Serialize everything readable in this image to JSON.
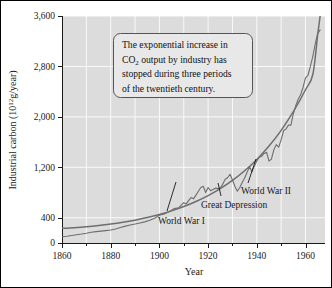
{
  "chart_data": {
    "type": "line",
    "title": "",
    "xlabel": "Year",
    "ylabel": "Industrial carbon (10^12 g/year)",
    "ylabel_parts": {
      "prefix": "Industrial carbon (10",
      "exponent": "12",
      "suffix": "g/year)"
    },
    "xlim": [
      1860,
      1968
    ],
    "ylim": [
      0,
      3600
    ],
    "grid": true,
    "grid_color": "#ffffff",
    "plot_background": "#dcdcdc",
    "legend": "none",
    "x_major_ticks": [
      1860,
      1880,
      1900,
      1920,
      1940,
      1960
    ],
    "x_major_tick_labels": [
      "1860",
      "1880",
      "1900",
      "1920",
      "1940",
      "1960"
    ],
    "x_minor_ticks": [
      1870,
      1890,
      1910,
      1930,
      1950
    ],
    "y_major_ticks": [
      0,
      400,
      1200,
      2000,
      2800,
      3600
    ],
    "y_major_tick_labels": [
      "0",
      "400",
      "1,200",
      "2,000",
      "2,800",
      "3,600"
    ],
    "series": [
      {
        "name": "Exponential fit",
        "style": "smooth",
        "color": "#6e6e6e",
        "points": [
          [
            1860,
            232
          ],
          [
            1865,
            243
          ],
          [
            1870,
            258
          ],
          [
            1875,
            277
          ],
          [
            1880,
            300
          ],
          [
            1885,
            328
          ],
          [
            1890,
            362
          ],
          [
            1895,
            403
          ],
          [
            1900,
            452
          ],
          [
            1905,
            510
          ],
          [
            1910,
            578
          ],
          [
            1915,
            658
          ],
          [
            1920,
            752
          ],
          [
            1925,
            862
          ],
          [
            1930,
            992
          ],
          [
            1935,
            1145
          ],
          [
            1940,
            1325
          ],
          [
            1945,
            1537
          ],
          [
            1950,
            1787
          ],
          [
            1955,
            2082
          ],
          [
            1960,
            2430
          ],
          [
            1963,
            2672
          ],
          [
            1965,
            3305
          ],
          [
            1966,
            3600
          ]
        ]
      },
      {
        "name": "Industrial carbon emissions",
        "style": "jagged",
        "color": "#6e6e6e",
        "points": [
          [
            1860,
            100
          ],
          [
            1862,
            108
          ],
          [
            1864,
            120
          ],
          [
            1866,
            132
          ],
          [
            1868,
            142
          ],
          [
            1870,
            155
          ],
          [
            1872,
            170
          ],
          [
            1874,
            180
          ],
          [
            1876,
            188
          ],
          [
            1878,
            196
          ],
          [
            1880,
            205
          ],
          [
            1882,
            222
          ],
          [
            1884,
            245
          ],
          [
            1886,
            268
          ],
          [
            1888,
            285
          ],
          [
            1890,
            300
          ],
          [
            1892,
            318
          ],
          [
            1894,
            335
          ],
          [
            1896,
            360
          ],
          [
            1898,
            392
          ],
          [
            1900,
            440
          ],
          [
            1902,
            462
          ],
          [
            1904,
            495
          ],
          [
            1906,
            545
          ],
          [
            1908,
            560
          ],
          [
            1909,
            600
          ],
          [
            1910,
            640
          ],
          [
            1911,
            620
          ],
          [
            1912,
            672
          ],
          [
            1913,
            720
          ],
          [
            1914,
            700
          ],
          [
            1915,
            760
          ],
          [
            1916,
            820
          ],
          [
            1917,
            880
          ],
          [
            1918,
            900
          ],
          [
            1919,
            800
          ],
          [
            1920,
            880
          ],
          [
            1921,
            830
          ],
          [
            1922,
            850
          ],
          [
            1923,
            870
          ],
          [
            1924,
            862
          ],
          [
            1925,
            880
          ],
          [
            1926,
            930
          ],
          [
            1927,
            1010
          ],
          [
            1928,
            1035
          ],
          [
            1929,
            1090
          ],
          [
            1930,
            1000
          ],
          [
            1931,
            900
          ],
          [
            1932,
            820
          ],
          [
            1933,
            880
          ],
          [
            1934,
            960
          ],
          [
            1935,
            1030
          ],
          [
            1936,
            1120
          ],
          [
            1937,
            1210
          ],
          [
            1938,
            1130
          ],
          [
            1939,
            1220
          ],
          [
            1940,
            1300
          ],
          [
            1941,
            1360
          ],
          [
            1942,
            1375
          ],
          [
            1943,
            1420
          ],
          [
            1944,
            1440
          ],
          [
            1945,
            1300
          ],
          [
            1946,
            1330
          ],
          [
            1947,
            1480
          ],
          [
            1948,
            1560
          ],
          [
            1949,
            1520
          ],
          [
            1950,
            1640
          ],
          [
            1951,
            1780
          ],
          [
            1952,
            1810
          ],
          [
            1953,
            1870
          ],
          [
            1954,
            1870
          ],
          [
            1955,
            2050
          ],
          [
            1956,
            2180
          ],
          [
            1957,
            2280
          ],
          [
            1958,
            2350
          ],
          [
            1959,
            2470
          ],
          [
            1960,
            2620
          ],
          [
            1961,
            2660
          ],
          [
            1962,
            2800
          ],
          [
            1963,
            2960
          ],
          [
            1964,
            3160
          ],
          [
            1965,
            3320
          ],
          [
            1966,
            3380
          ]
        ]
      }
    ],
    "annotations": [
      {
        "id": "callout",
        "kind": "text-box",
        "lines": [
          "The exponential increase in",
          "CO2 output by industry has",
          "stopped during three periods",
          "of the twentieth century."
        ],
        "line2_parts": {
          "prefix": "CO",
          "subscript": "2",
          "suffix": " output by industry has"
        }
      },
      {
        "id": "world-war-1",
        "kind": "leader-label",
        "label": "World War I",
        "target_year": 1915,
        "target_value": 860
      },
      {
        "id": "great-depression",
        "kind": "leader-label",
        "label": "Great Depression",
        "target_year": 1932,
        "target_value": 830
      },
      {
        "id": "world-war-2",
        "kind": "leader-label",
        "label": "World War II",
        "target_year": 1946,
        "target_value": 1340
      }
    ]
  },
  "figure": {
    "border_color": "#000000",
    "axis_color": "#1a1a1a"
  }
}
